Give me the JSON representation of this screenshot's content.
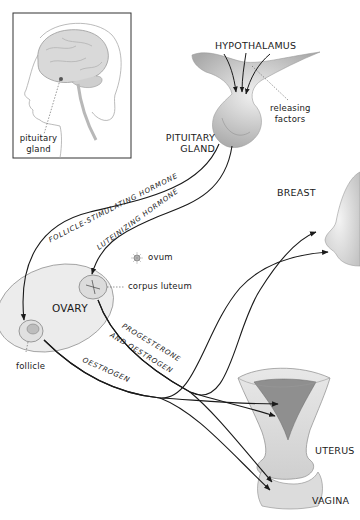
{
  "diagram": {
    "inset": {
      "label": "pituitary gland"
    },
    "labels": {
      "hypothalamus": "HYPOTHALAMUS",
      "releasing_factors": "releasing factors",
      "pituitary_gland": "PITUITARY GLAND",
      "breast": "BREAST",
      "ovum": "ovum",
      "corpus_luteum": "corpus luteum",
      "ovary": "OVARY",
      "follicle": "follicle",
      "uterus": "UTERUS",
      "vagina": "VAGINA"
    },
    "hormones": {
      "fsh": "FOLLICLE-STIMULATING HORMONE",
      "lh": "LUTEINIZING HORMONE",
      "prog_line1": "PROGESTERONE",
      "prog_line2": "AND OESTROGEN",
      "oestrogen": "OESTROGEN"
    },
    "colors": {
      "line": "#1a1a1a",
      "shading": "#cfcfcf",
      "inset_border": "#333333"
    }
  }
}
